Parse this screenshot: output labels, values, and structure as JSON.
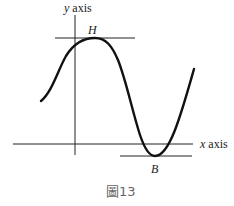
{
  "figure": {
    "caption": "圖13",
    "axes": {
      "x_label_var": "x",
      "x_label_word": "axis",
      "y_label_var": "y",
      "y_label_word": "axis"
    },
    "points": {
      "max_label": "H",
      "min_label": "B"
    },
    "colors": {
      "ink": "#111111",
      "caption": "#666666",
      "background": "#ffffff"
    }
  }
}
